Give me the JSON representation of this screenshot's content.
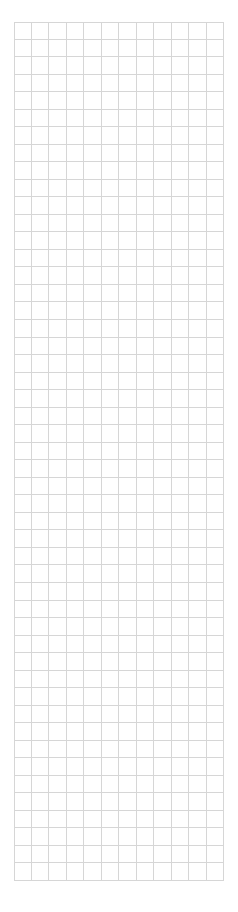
{
  "page": {
    "background_color": "#ffffff",
    "width_px": 238,
    "height_px": 912
  },
  "grid": {
    "name": "empty-grid",
    "columns": 12,
    "rows": 49,
    "cell_width_px": 17.5,
    "cell_height_px": 17.53,
    "origin_x_px": 14,
    "origin_y_px": 22,
    "width_px": 210,
    "height_px": 859,
    "line_color": "#d6d6d6",
    "line_width_px": 1,
    "fill_color": "#ffffff",
    "cell_text": ""
  }
}
